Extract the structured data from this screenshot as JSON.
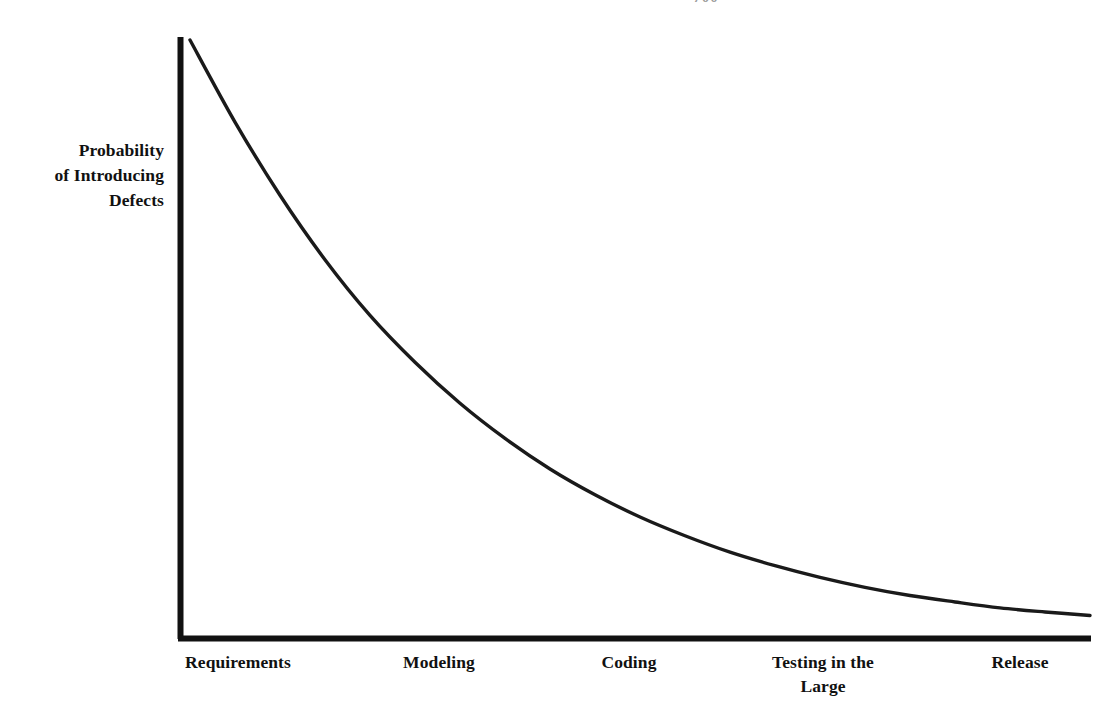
{
  "figure": {
    "page_artifact": "700",
    "background_color": "#ffffff",
    "ink_color": "#111111"
  },
  "axes": {
    "y_title": "Probability\nof Introducing\nDefects",
    "x_title": ""
  },
  "chart_data": {
    "type": "line",
    "title": "",
    "subtitle": "",
    "xlabel": "",
    "ylabel": "Probability of Introducing Defects",
    "categories": [
      "Requirements",
      "Modeling",
      "Coding",
      "Testing in the\nLarge",
      "Release"
    ],
    "tick_labels": [
      "Requirements",
      "Modeling",
      "Coding",
      "Testing in the Large",
      "Release"
    ],
    "legend": [],
    "legend_position": "none",
    "grid": false,
    "axis_ranges": {
      "x": [
        0,
        1
      ],
      "y": [
        0,
        1
      ]
    },
    "axis_ticks_shown": false,
    "series": [
      {
        "name": "Probability of Introducing Defects",
        "color": "#111111",
        "line_width_px": 3,
        "shape": "exponential-decay",
        "x": [
          0.0,
          0.05,
          0.1,
          0.15,
          0.2,
          0.25,
          0.3,
          0.35,
          0.4,
          0.45,
          0.5,
          0.55,
          0.6,
          0.65,
          0.7,
          0.75,
          0.8,
          0.85,
          0.9,
          0.95,
          1.0
        ],
        "values": [
          1.0,
          0.86,
          0.735,
          0.625,
          0.53,
          0.45,
          0.38,
          0.32,
          0.268,
          0.224,
          0.186,
          0.154,
          0.126,
          0.103,
          0.083,
          0.066,
          0.052,
          0.041,
          0.031,
          0.024,
          0.018
        ]
      }
    ],
    "category_values": [
      1.0,
      0.46,
      0.186,
      0.066,
      0.018
    ],
    "annotations": []
  }
}
